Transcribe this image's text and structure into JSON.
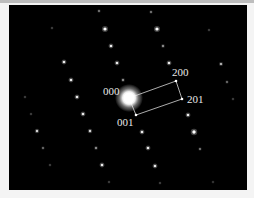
{
  "figure": {
    "type": "selected-area electron diffraction pattern",
    "background_color": "#000000",
    "spot_color": "#ffffff",
    "annotation_color": "#e8e8e8"
  },
  "labels": [
    {
      "text": "000",
      "x": 103,
      "y": 86
    },
    {
      "text": "200",
      "x": 172,
      "y": 67
    },
    {
      "text": "201",
      "x": 187,
      "y": 94
    },
    {
      "text": "001",
      "x": 117,
      "y": 117
    }
  ],
  "annotated_points": {
    "000": {
      "x": 129,
      "y": 98
    },
    "200": {
      "x": 176,
      "y": 81
    },
    "201": {
      "x": 182,
      "y": 99
    },
    "001": {
      "x": 136,
      "y": 115
    }
  },
  "central_spot": {
    "x": 129,
    "y": 98,
    "r": 7,
    "glow_r": 14
  },
  "spots": [
    {
      "x": 99,
      "y": 11,
      "r": 0.9,
      "o": 0.5
    },
    {
      "x": 151,
      "y": 12,
      "r": 0.9,
      "o": 0.5
    },
    {
      "x": 52,
      "y": 28,
      "r": 0.8,
      "o": 0.35
    },
    {
      "x": 105,
      "y": 29,
      "r": 1.6,
      "o": 1.0
    },
    {
      "x": 157,
      "y": 29,
      "r": 1.6,
      "o": 1.0
    },
    {
      "x": 209,
      "y": 30,
      "r": 0.8,
      "o": 0.35
    },
    {
      "x": 111,
      "y": 46,
      "r": 1.3,
      "o": 0.9
    },
    {
      "x": 163,
      "y": 46,
      "r": 1.0,
      "o": 0.6
    },
    {
      "x": 64,
      "y": 62,
      "r": 1.3,
      "o": 0.9
    },
    {
      "x": 117,
      "y": 63,
      "r": 1.3,
      "o": 0.9
    },
    {
      "x": 169,
      "y": 63,
      "r": 1.3,
      "o": 0.9
    },
    {
      "x": 221,
      "y": 64,
      "r": 1.1,
      "o": 0.75
    },
    {
      "x": 71,
      "y": 80,
      "r": 1.3,
      "o": 0.9
    },
    {
      "x": 123,
      "y": 80,
      "r": 1.0,
      "o": 0.6
    },
    {
      "x": 227,
      "y": 82,
      "r": 0.9,
      "o": 0.45
    },
    {
      "x": 25,
      "y": 97,
      "r": 0.8,
      "o": 0.35
    },
    {
      "x": 77,
      "y": 97,
      "r": 1.3,
      "o": 0.9
    },
    {
      "x": 233,
      "y": 99,
      "r": 0.8,
      "o": 0.35
    },
    {
      "x": 31,
      "y": 114,
      "r": 0.8,
      "o": 0.35
    },
    {
      "x": 83,
      "y": 114,
      "r": 1.3,
      "o": 0.9
    },
    {
      "x": 188,
      "y": 115,
      "r": 1.3,
      "o": 0.9
    },
    {
      "x": 37,
      "y": 131,
      "r": 1.2,
      "o": 0.8
    },
    {
      "x": 90,
      "y": 131,
      "r": 1.2,
      "o": 0.8
    },
    {
      "x": 142,
      "y": 132,
      "r": 1.3,
      "o": 0.9
    },
    {
      "x": 194,
      "y": 132,
      "r": 1.7,
      "o": 1.0
    },
    {
      "x": 43,
      "y": 148,
      "r": 0.9,
      "o": 0.45
    },
    {
      "x": 96,
      "y": 148,
      "r": 1.0,
      "o": 0.6
    },
    {
      "x": 148,
      "y": 148,
      "r": 1.3,
      "o": 0.9
    },
    {
      "x": 200,
      "y": 149,
      "r": 0.9,
      "o": 0.5
    },
    {
      "x": 50,
      "y": 165,
      "r": 0.8,
      "o": 0.35
    },
    {
      "x": 102,
      "y": 165,
      "r": 1.3,
      "o": 0.9
    },
    {
      "x": 155,
      "y": 166,
      "r": 1.3,
      "o": 0.9
    },
    {
      "x": 109,
      "y": 182,
      "r": 0.8,
      "o": 0.35
    },
    {
      "x": 160,
      "y": 183,
      "r": 0.8,
      "o": 0.35
    },
    {
      "x": 213,
      "y": 182,
      "r": 0.8,
      "o": 0.3
    }
  ]
}
